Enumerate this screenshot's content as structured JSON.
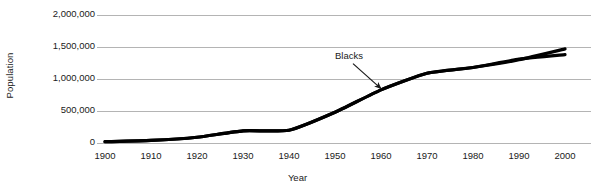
{
  "chart_data": {
    "type": "line",
    "title": "",
    "subtitle": "",
    "xlabel": "Year",
    "ylabel": "Population",
    "xlim": [
      1900,
      2000
    ],
    "ylim": [
      0,
      2000000
    ],
    "grid": true,
    "grid_axis": "y",
    "legend": "none",
    "xticks": [
      "1900",
      "1910",
      "1920",
      "1930",
      "1940",
      "1950",
      "1960",
      "1970",
      "1980",
      "1990",
      "2000"
    ],
    "xtick_values": [
      1900,
      1910,
      1920,
      1930,
      1940,
      1950,
      1960,
      1970,
      1980,
      1990,
      2000
    ],
    "yticks": [
      "0",
      "500,000",
      "1,000,000",
      "1,500,000",
      "2,000,000"
    ],
    "ytick_values": [
      0,
      500000,
      1000000,
      1500000,
      2000000
    ],
    "x": [
      1900,
      1910,
      1920,
      1930,
      1940,
      1950,
      1960,
      1970,
      1980,
      1990,
      2000
    ],
    "series": [
      {
        "name": "Blacks",
        "color": "#000000",
        "values": [
          20000,
          40000,
          90000,
          190000,
          200000,
          480000,
          830000,
          1090000,
          1180000,
          1300000,
          1470000
        ]
      },
      {
        "name": "Blacks alternate",
        "color": "#000000",
        "values": [
          20000,
          40000,
          90000,
          190000,
          200000,
          480000,
          830000,
          1090000,
          1180000,
          1310000,
          1380000
        ]
      }
    ],
    "annotations": [
      {
        "text": "Blacks",
        "target_x": 1960,
        "target_y": 850000
      }
    ]
  },
  "colors": {
    "line": "#000000",
    "grid": "#b4b4b4",
    "text": "#1a1a1a",
    "background": "#ffffff"
  }
}
